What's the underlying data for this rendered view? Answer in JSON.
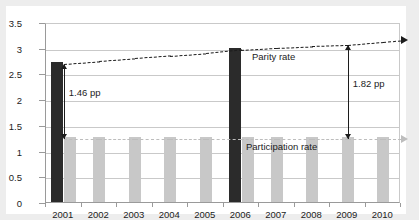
{
  "chart_data": {
    "type": "bar",
    "title": "",
    "xlabel": "",
    "ylabel": "",
    "categories": [
      "2001",
      "2002",
      "2003",
      "2004",
      "2005",
      "2006",
      "2007",
      "2008",
      "2009",
      "2010"
    ],
    "ylim": [
      0,
      3.5
    ],
    "yticks": [
      "0",
      "0.5",
      "1",
      "1.5",
      "2",
      "2.5",
      "3",
      "3.5"
    ],
    "ytick_values": [
      0,
      0.5,
      1,
      1.5,
      2,
      2.5,
      3,
      3.5
    ],
    "grid": true,
    "legend_position": "inline-labels",
    "series": [
      {
        "name": "Parity rate",
        "render": "bar-dark-highlight",
        "color": "#2b2b2b",
        "values": [
          2.73,
          null,
          null,
          null,
          null,
          3.0,
          null,
          null,
          null,
          null
        ]
      },
      {
        "name": "Participation rate",
        "render": "bar-light",
        "color": "#c8c8c8",
        "values": [
          1.27,
          1.27,
          1.27,
          1.27,
          1.27,
          1.27,
          1.27,
          1.27,
          1.27,
          1.27
        ]
      },
      {
        "name": "Parity rate",
        "render": "dashed-line",
        "color": "#1c1c1c",
        "values": [
          2.73,
          2.78,
          2.83,
          2.88,
          2.93,
          3.0,
          3.04,
          3.07,
          3.09,
          3.15
        ]
      },
      {
        "name": "Participation rate",
        "render": "dashed-line",
        "color": "#bdbdbd",
        "values": [
          1.27,
          1.27,
          1.27,
          1.27,
          1.27,
          1.27,
          1.27,
          1.27,
          1.27,
          1.27
        ]
      }
    ],
    "annotations": [
      {
        "label": "1.46 pp",
        "at_category": "2001",
        "from": 2.73,
        "to": 1.27,
        "style": "double-arrow"
      },
      {
        "label": "1.82 pp",
        "at_category": "2009",
        "from": 3.09,
        "to": 1.27,
        "style": "double-arrow"
      }
    ],
    "inline_labels": [
      {
        "text": "Parity rate",
        "series": "Parity rate"
      },
      {
        "text": "Participation rate",
        "series": "Participation rate"
      }
    ],
    "colors": {
      "bar_dark": "#2b2b2b",
      "bar_light": "#c8c8c8",
      "gridline": "#c9c9c9",
      "axis": "#9a9a9a",
      "text": "#1c1c1c",
      "plot_background": "#ffffff",
      "page_background": "#ededed"
    }
  }
}
